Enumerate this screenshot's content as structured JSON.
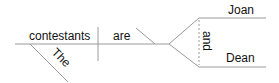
{
  "diagram": {
    "type": "sentence-diagram",
    "words": {
      "subject": "contestants",
      "verb": "are",
      "modifier": "The",
      "complement_top": "Joan",
      "complement_bottom": "Dean",
      "conjunction": "and"
    },
    "colors": {
      "line": "#9a9a9a",
      "text": "#111111"
    }
  }
}
